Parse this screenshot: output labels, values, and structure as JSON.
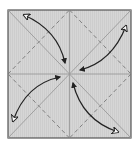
{
  "diagram": {
    "type": "origami-crease-pattern",
    "colors": {
      "paper_fill": "#d4d4d4",
      "border": "#555555",
      "crease_solid": "#9a9a9a",
      "crease_dashed": "#777777",
      "arrow": "#222222",
      "arrow_open_head_fill": "#ffffff"
    },
    "square": {
      "x": 8,
      "y": 10,
      "width": 123,
      "height": 128
    },
    "center": {
      "x": 69.5,
      "y": 74
    },
    "creases": {
      "solid": [
        "horizontal-midline",
        "vertical-midline",
        "diagonal-tl-br",
        "diagonal-tr-bl"
      ],
      "dashed": [
        "top-mid-to-right-mid",
        "right-mid-to-bottom-mid",
        "bottom-mid-to-left-mid",
        "left-mid-to-top-mid"
      ]
    },
    "arrows": [
      {
        "name": "top-left-corner-to-center",
        "from": "top-left",
        "to": "center"
      },
      {
        "name": "top-right-corner-to-center",
        "from": "top-right",
        "to": "center"
      },
      {
        "name": "bottom-left-corner-to-center",
        "from": "bottom-left",
        "to": "center"
      },
      {
        "name": "bottom-right-corner-to-center",
        "from": "bottom-right",
        "to": "center"
      }
    ]
  }
}
